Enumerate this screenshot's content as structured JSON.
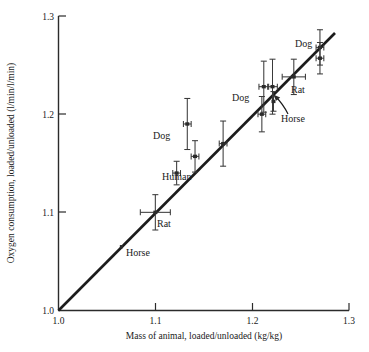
{
  "chart_data": {
    "type": "scatter",
    "title": "",
    "xlabel": "Mass of animal, loaded/unloaded (kg/kg)",
    "ylabel": "Oxygen consumption, loaded/unloaded (l/min/l/min)",
    "xlim": [
      1.0,
      1.3
    ],
    "ylim": [
      1.0,
      1.3
    ],
    "xticks": [
      "1.0",
      "1.1",
      "1.2",
      "1.3"
    ],
    "xtick_values": [
      1.0,
      1.1,
      1.2,
      1.3
    ],
    "yticks": [
      "1.0",
      "1.1",
      "1.2",
      "1.3"
    ],
    "ytick_values": [
      1.0,
      1.1,
      1.2,
      1.3
    ],
    "grid": false,
    "legend": false,
    "reference_line": {
      "name": "identity-line",
      "description": "line of equality, slope 1",
      "x0": 1.0,
      "y0": 1.0,
      "x1": 1.285,
      "y1": 1.285
    },
    "points": [
      {
        "id": "horse-low",
        "species": "Horse",
        "x": 1.065,
        "y": 1.065,
        "xerr": 0.0,
        "yerr": 0.0,
        "marker": "dot"
      },
      {
        "id": "rat-low",
        "species": "Rat",
        "x": 1.1,
        "y": 1.1,
        "xerr": 0.0155,
        "yerr": 0.018,
        "marker": "cross"
      },
      {
        "id": "human",
        "species": "Human",
        "x": 1.122,
        "y": 1.14,
        "xerr": 0.004,
        "yerr": 0.012,
        "marker": "cross"
      },
      {
        "id": "dog-a",
        "species": "Dog",
        "x": 1.133,
        "y": 1.19,
        "xerr": 0.004,
        "yerr": 0.026,
        "marker": "cross"
      },
      {
        "id": "dog-b",
        "species": "Dog",
        "x": 1.141,
        "y": 1.157,
        "xerr": 0.004,
        "yerr": 0.016,
        "marker": "cross"
      },
      {
        "id": "dog-c",
        "species": "Dog",
        "x": 1.17,
        "y": 1.17,
        "xerr": 0.004,
        "yerr": 0.023,
        "marker": "cross"
      },
      {
        "id": "dog-d",
        "species": "Dog",
        "x": 1.21,
        "y": 1.2,
        "xerr": 0.004,
        "yerr": 0.018,
        "marker": "cross"
      },
      {
        "id": "dog-e",
        "species": "Dog",
        "x": 1.212,
        "y": 1.228,
        "xerr": 0.005,
        "yerr": 0.026,
        "marker": "cross"
      },
      {
        "id": "dog-f",
        "species": "Dog",
        "x": 1.221,
        "y": 1.228,
        "xerr": 0.005,
        "yerr": 0.028,
        "marker": "cross"
      },
      {
        "id": "horse-high",
        "species": "Horse",
        "x": 1.222,
        "y": 1.213,
        "xerr": 0.0,
        "yerr": 0.01,
        "marker": "cross"
      },
      {
        "id": "rat-high",
        "species": "Rat",
        "x": 1.243,
        "y": 1.238,
        "xerr": 0.012,
        "yerr": 0.018,
        "marker": "cross"
      },
      {
        "id": "dog-g",
        "species": "Dog",
        "x": 1.27,
        "y": 1.268,
        "xerr": 0.004,
        "yerr": 0.018,
        "marker": "cross"
      },
      {
        "id": "dog-h",
        "species": "Dog",
        "x": 1.27,
        "y": 1.257,
        "xerr": 0.004,
        "yerr": 0.016,
        "marker": "cross"
      }
    ],
    "annotations": [
      {
        "id": "label-dog-left",
        "text": "Dog",
        "x": 0.0,
        "y": 0.0,
        "px": 153,
        "py": 139,
        "leader": false
      },
      {
        "id": "label-human",
        "text": "Human",
        "x": 0.0,
        "y": 0.0,
        "px": 162,
        "py": 180,
        "leader": false
      },
      {
        "id": "label-rat-low",
        "text": "Rat",
        "x": 0.0,
        "y": 0.0,
        "px": 157,
        "py": 227,
        "leader": false
      },
      {
        "id": "label-horse-low",
        "text": "Horse",
        "x": 0.0,
        "y": 0.0,
        "px": 126,
        "py": 256,
        "leader": false
      },
      {
        "id": "label-dog-mid",
        "text": "Dog",
        "x": 0.0,
        "y": 0.0,
        "px": 232,
        "py": 101,
        "leader": false
      },
      {
        "id": "label-horse-high",
        "text": "Horse",
        "x": 0.0,
        "y": 0.0,
        "px": 281,
        "py": 120,
        "leader": true
      },
      {
        "id": "label-rat-high",
        "text": "Rat",
        "x": 0.0,
        "y": 0.0,
        "px": 291,
        "py": 93,
        "leader": false
      },
      {
        "id": "label-dog-right",
        "text": "Dog",
        "x": 0.0,
        "y": 0.0,
        "px": 295,
        "py": 47,
        "leader": false
      }
    ]
  },
  "colors": {
    "axis": "#2b2b2b",
    "line": "#1c1c1c",
    "marker": "#2b2b2b",
    "error_bar": "#3a3a3a",
    "background": "#ffffff"
  }
}
